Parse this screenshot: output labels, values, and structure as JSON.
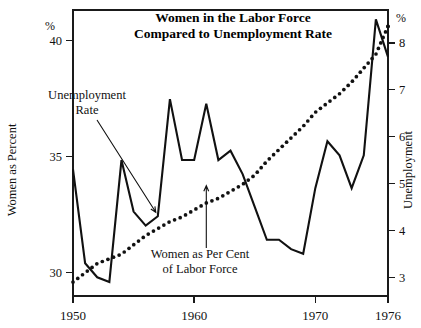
{
  "chart_data": {
    "type": "line",
    "title": "Women in the Labor Force\nCompared to Unemployment Rate",
    "title_line1": "Women in the Labor Force",
    "title_line2": "Compared to Unemployment Rate",
    "xlabel": "",
    "x_ticks": [
      1950,
      1960,
      1970,
      1976
    ],
    "x_tick_labels": [
      "1950",
      "1960",
      "1970",
      "1976"
    ],
    "xlim": [
      1950,
      1976
    ],
    "grid": false,
    "legend_position": "inline-annotations",
    "left_axis": {
      "label": "Women as Percent",
      "unit_symbol": "%",
      "ticks": [
        30,
        35,
        40
      ],
      "tick_labels": [
        "30",
        "35",
        "40"
      ],
      "ylim": [
        29.0,
        41.3
      ]
    },
    "right_axis": {
      "label": "Unemployment",
      "unit_symbol": "%",
      "ticks": [
        3,
        4,
        5,
        6,
        7,
        8
      ],
      "tick_labels": [
        "3",
        "4",
        "5",
        "6",
        "7",
        "8"
      ],
      "ylim": [
        2.6,
        8.7
      ]
    },
    "annotations": [
      {
        "name": "unemployment-rate-annotation",
        "line1": "Unemployment",
        "line2": "Rate",
        "target_year": 1957,
        "target_value": 4.3
      },
      {
        "name": "women-share-annotation",
        "line1": "Women as Per Cent",
        "line2": "of Labor Force",
        "target_year": 1961,
        "target_value": 34.0
      }
    ],
    "series": [
      {
        "name": "Unemployment Rate",
        "style": "solid",
        "axis": "right",
        "x": [
          1950,
          1951,
          1952,
          1953,
          1954,
          1955,
          1956,
          1957,
          1958,
          1959,
          1960,
          1961,
          1962,
          1963,
          1964,
          1965,
          1966,
          1967,
          1968,
          1969,
          1970,
          1971,
          1972,
          1973,
          1974,
          1975,
          1976
        ],
        "values": [
          5.3,
          3.3,
          3.0,
          2.9,
          5.5,
          4.4,
          4.1,
          4.3,
          6.8,
          5.5,
          5.5,
          6.7,
          5.5,
          5.7,
          5.2,
          4.5,
          3.8,
          3.8,
          3.6,
          3.5,
          4.9,
          5.9,
          5.6,
          4.9,
          5.6,
          8.5,
          7.7
        ]
      },
      {
        "name": "Women as Per Cent of Labor Force",
        "style": "dotted",
        "axis": "left",
        "x": [
          1950,
          1951,
          1952,
          1953,
          1954,
          1955,
          1956,
          1957,
          1958,
          1959,
          1960,
          1961,
          1962,
          1963,
          1964,
          1965,
          1966,
          1967,
          1968,
          1969,
          1970,
          1971,
          1972,
          1973,
          1974,
          1975,
          1976
        ],
        "values": [
          29.6,
          30.0,
          30.4,
          30.6,
          30.8,
          31.2,
          31.6,
          31.9,
          32.2,
          32.4,
          32.7,
          33.0,
          33.2,
          33.5,
          33.8,
          34.2,
          34.8,
          35.3,
          35.8,
          36.3,
          36.9,
          37.3,
          37.7,
          38.2,
          38.8,
          39.4,
          40.6
        ]
      }
    ]
  }
}
